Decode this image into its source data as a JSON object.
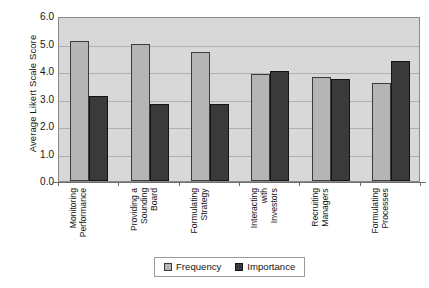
{
  "chart_data": {
    "type": "bar",
    "title": "",
    "subtitle": "",
    "xlabel": "",
    "ylabel": "Average Likert Scale Score",
    "ylim": [
      0.0,
      6.0
    ],
    "ytick_step": 1.0,
    "ytick_labels": [
      "6.0",
      "5.0",
      "4.0",
      "3.0",
      "2.0",
      "1.0",
      "0.0"
    ],
    "ytick_values": [
      6.0,
      5.0,
      4.0,
      3.0,
      2.0,
      1.0,
      0.0
    ],
    "grid": true,
    "grid_axis": "y",
    "legend_position": "bottom-center",
    "orientation": "vertical",
    "grouping": "grouped",
    "xtick_label_rotation": 90,
    "categories": [
      "Monitoring Performance",
      "Providing a Sounding Board",
      "Formulating Strategy",
      "Interacting with Investors",
      "Recruiting Managers",
      "Formulating Processes"
    ],
    "category_lines": [
      [
        "Monitoring",
        "Performance"
      ],
      [
        "Providing a",
        "Sounding",
        "Board"
      ],
      [
        "Formulating",
        "Strategy"
      ],
      [
        "Interacting",
        "with",
        "Investors"
      ],
      [
        "Recruiting",
        "Managers"
      ],
      [
        "Formulating",
        "Processes"
      ]
    ],
    "series": [
      {
        "name": "Frequency",
        "color": "#b5b5b5",
        "edge_color": "#3c3c3c",
        "values": [
          5.1,
          5.0,
          4.7,
          3.9,
          3.8,
          3.55
        ]
      },
      {
        "name": "Importance",
        "color": "#3a3a3a",
        "edge_color": "#141414",
        "values": [
          3.1,
          2.8,
          2.8,
          4.0,
          3.7,
          4.35
        ]
      }
    ]
  },
  "legend": {
    "entries": [
      {
        "label": "Frequency"
      },
      {
        "label": "Importance"
      }
    ]
  },
  "style": {
    "plot_background": "#d8d8d8",
    "page_background": "#ffffff",
    "gridline_color": "#b0b0b0",
    "axis_color": "#6e6e6e",
    "text_color": "#141414"
  }
}
